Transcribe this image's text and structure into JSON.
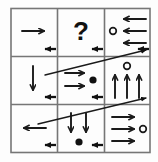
{
  "figure": {
    "type": "matrix-reasoning-puzzle",
    "grid_rows": 3,
    "grid_cols": 3,
    "stroke_color": "#1a1a1a",
    "grid_color": "#6e6e6e",
    "background_color": "#ffffff",
    "missing_cell_symbol": "?"
  },
  "cells": [
    {
      "id": "cell-r1c1",
      "row": 1,
      "col": 1,
      "contents": "one large right-pointing arrow",
      "arrow_count": 1,
      "arrow_direction": "right",
      "marker": "none"
    },
    {
      "id": "cell-r1c2",
      "row": 1,
      "col": 2,
      "contents": "question mark",
      "label": "?",
      "arrow_count": 0,
      "arrow_direction": "none",
      "marker": "none"
    },
    {
      "id": "cell-r1c3",
      "row": 1,
      "col": 3,
      "contents": "three left-pointing arrows with open circle",
      "arrow_count": 3,
      "arrow_direction": "left",
      "marker": "open-circle",
      "marker_position": "left-of-middle-arrow"
    },
    {
      "id": "cell-r2c1",
      "row": 2,
      "col": 1,
      "contents": "one large down-pointing arrow",
      "arrow_count": 1,
      "arrow_direction": "down",
      "marker": "none"
    },
    {
      "id": "cell-r2c2",
      "row": 2,
      "col": 2,
      "contents": "two right-pointing arrows with filled dot",
      "arrow_count": 2,
      "arrow_direction": "right",
      "marker": "filled-dot",
      "marker_position": "right-of-arrows"
    },
    {
      "id": "cell-r2c3",
      "row": 2,
      "col": 3,
      "contents": "three up-pointing arrows with open circle",
      "arrow_count": 3,
      "arrow_direction": "up",
      "marker": "open-circle",
      "marker_position": "above-middle-arrow"
    },
    {
      "id": "cell-r3c1",
      "row": 3,
      "col": 1,
      "contents": "one large left-pointing arrow",
      "arrow_count": 1,
      "arrow_direction": "left",
      "marker": "none"
    },
    {
      "id": "cell-r3c2",
      "row": 3,
      "col": 2,
      "contents": "two down-pointing arrows with filled dot",
      "arrow_count": 2,
      "arrow_direction": "down",
      "marker": "filled-dot",
      "marker_position": "below-arrows"
    },
    {
      "id": "cell-r3c3",
      "row": 3,
      "col": 3,
      "contents": "three right-pointing arrows with open circle",
      "arrow_count": 3,
      "arrow_direction": "right",
      "marker": "open-circle",
      "marker_position": "right-of-middle-arrow"
    }
  ],
  "edge_markers": [
    {
      "id": "edge-marker-1",
      "direction": "left",
      "on_boundary": "row1-row2",
      "near_col": 1
    },
    {
      "id": "edge-marker-2",
      "direction": "left",
      "on_boundary": "row1-row2",
      "near_col": 2
    },
    {
      "id": "edge-marker-3",
      "direction": "left",
      "on_boundary": "row1-row2",
      "near_col": 3
    },
    {
      "id": "edge-marker-4",
      "direction": "left",
      "on_boundary": "row2-row3",
      "near_col": 1
    },
    {
      "id": "edge-marker-5",
      "direction": "left",
      "on_boundary": "row2-row3",
      "near_col": 2
    },
    {
      "id": "edge-marker-6",
      "direction": "left",
      "on_boundary": "row3-bottom",
      "near_col": 1
    },
    {
      "id": "edge-marker-7",
      "direction": "left",
      "on_boundary": "row3-bottom",
      "near_col": 2
    }
  ],
  "diagonal_arrows": [
    {
      "id": "diagonal-arrow-upper",
      "from": "lower-left",
      "to": "upper-right",
      "arrowhead": "right-end",
      "crosses_rows": "row2 to row1-row2 boundary"
    },
    {
      "id": "diagonal-arrow-lower",
      "from": "lower-left",
      "to": "upper-right",
      "arrowhead": "right-end",
      "crosses_rows": "row3 to row2-row3 boundary"
    }
  ]
}
